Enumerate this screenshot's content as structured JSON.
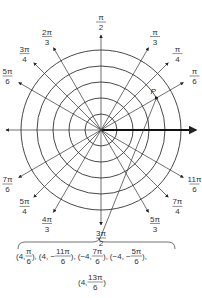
{
  "diagram": {
    "circles": [
      1,
      2,
      3,
      4,
      5
    ],
    "rays": [
      {
        "angle_num": 0,
        "angle_den": 1,
        "label_num": "0",
        "label_den": ""
      },
      {
        "angle_num": 1,
        "angle_den": 6,
        "label_num": "π",
        "label_den": "6"
      },
      {
        "angle_num": 1,
        "angle_den": 4,
        "label_num": "π",
        "label_den": "4"
      },
      {
        "angle_num": 1,
        "angle_den": 3,
        "label_num": "π",
        "label_den": "3"
      },
      {
        "angle_num": 1,
        "angle_den": 2,
        "label_num": "π",
        "label_den": "2"
      },
      {
        "angle_num": 2,
        "angle_den": 3,
        "label_num": "2π",
        "label_den": "3"
      },
      {
        "angle_num": 3,
        "angle_den": 4,
        "label_num": "3π",
        "label_den": "4"
      },
      {
        "angle_num": 5,
        "angle_den": 6,
        "label_num": "5π",
        "label_den": "6"
      },
      {
        "angle_num": 1,
        "angle_den": 1,
        "label_num": "π",
        "label_den": ""
      },
      {
        "angle_num": 7,
        "angle_den": 6,
        "label_num": "7π",
        "label_den": "6"
      },
      {
        "angle_num": 5,
        "angle_den": 4,
        "label_num": "5π",
        "label_den": "4"
      },
      {
        "angle_num": 4,
        "angle_den": 3,
        "label_num": "4π",
        "label_den": "3"
      },
      {
        "angle_num": 3,
        "angle_den": 2,
        "label_num": "3π",
        "label_den": "2"
      },
      {
        "angle_num": 5,
        "angle_den": 3,
        "label_num": "5π",
        "label_den": "3"
      },
      {
        "angle_num": 7,
        "angle_den": 4,
        "label_num": "7π",
        "label_den": "4"
      },
      {
        "angle_num": 11,
        "angle_den": 6,
        "label_num": "11π",
        "label_den": "6"
      }
    ],
    "point": {
      "label": "P",
      "r": 4,
      "angle_num": 1,
      "angle_den": 6
    },
    "caption": {
      "line1": [
        {
          "pre": "(4, ",
          "num": "π",
          "den": "6",
          "post": "),"
        },
        {
          "pre": "(4, −",
          "num": "11π",
          "den": "6",
          "post": "),"
        },
        {
          "pre": "(−4, ",
          "num": "7π",
          "den": "6",
          "post": "),"
        },
        {
          "pre": "(−4, −",
          "num": "5π",
          "den": "6",
          "post": "),"
        }
      ],
      "line2": [
        {
          "pre": "(4, ",
          "num": "13π",
          "den": "6",
          "post": ")"
        }
      ]
    },
    "colors": {
      "line": "#333333",
      "axis": "#111111"
    }
  }
}
